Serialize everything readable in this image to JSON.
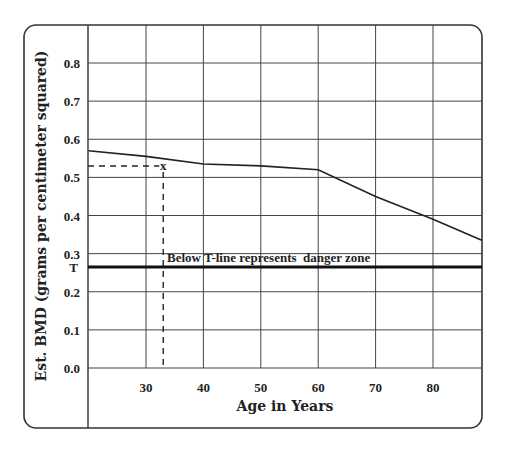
{
  "chart_data": {
    "type": "line",
    "title": "",
    "xlabel": "Age in Years",
    "ylabel": "Est. BMD (grams per centimeter squared)",
    "x_ticks": [
      30,
      40,
      50,
      60,
      70,
      80
    ],
    "y_ticks": [
      0.0,
      0.1,
      0.2,
      0.3,
      0.4,
      0.5,
      0.6,
      0.7,
      0.8
    ],
    "y_tick_labels": [
      "0.0",
      "0.1",
      "0.2",
      "0.3",
      "0.4",
      "0.5",
      "0.6",
      "0.7",
      "0.8"
    ],
    "xlim": [
      20,
      88.5
    ],
    "ylim": [
      0.0,
      0.9
    ],
    "grid": true,
    "series": [
      {
        "name": "Estimated BMD",
        "x": [
          20,
          30,
          40,
          50,
          60,
          70,
          80,
          88.5
        ],
        "values": [
          0.57,
          0.555,
          0.535,
          0.53,
          0.52,
          0.45,
          0.39,
          0.335
        ]
      }
    ],
    "threshold": {
      "label": "T",
      "value": 0.265,
      "annotation": "Below T-line represents  danger zone"
    },
    "marker": {
      "symbol": "x",
      "x": 33,
      "y": 0.53,
      "guide_lines": "dashed"
    }
  },
  "labels": {
    "x_axis_title": "Age in Years",
    "y_axis_title": "Est. BMD (grams per centimeter squared)",
    "t_label": "T",
    "annotation": "Below T-line represents  danger zone",
    "marker_symbol": "x"
  }
}
